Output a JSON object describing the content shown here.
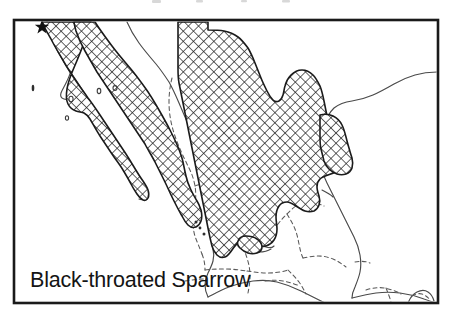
{
  "figure": {
    "kind": "species-range-map",
    "caption": "Black-throated Sparrow",
    "region_label": "Mexico and Baja California",
    "frame": {
      "x": 14,
      "y": 20,
      "width": 424,
      "height": 283,
      "stroke_color": "#1a1a1a",
      "fill_color": "#ffffff"
    },
    "legend": {
      "range_fill_label": "cross-hatched breeding/resident range",
      "range_pattern": "cross-hatch",
      "range_stroke_color": "#1b1b1b",
      "coastline_color": "#4a4a4a",
      "state_border_color": "#585858",
      "state_border_style": "dashed",
      "marker_label": "star-marker",
      "marker_color": "#121212"
    },
    "markers": [
      {
        "name": "star-marker",
        "glyph": "star",
        "x": 42,
        "y": 26
      }
    ],
    "islands": [
      {
        "name": "isla-guadalupe",
        "x": 33,
        "y": 88
      },
      {
        "name": "isla-cedros",
        "x": 71,
        "y": 99
      },
      {
        "name": "isla-angel-de-la-guarda",
        "x": 99,
        "y": 91
      },
      {
        "name": "isla-tiburon",
        "x": 115,
        "y": 88
      },
      {
        "name": "isla-santa-margarita",
        "x": 67,
        "y": 118
      },
      {
        "name": "islas-marias-a",
        "x": 196,
        "y": 222
      },
      {
        "name": "islas-marias-b",
        "x": 200,
        "y": 228
      },
      {
        "name": "islas-marias-c",
        "x": 204,
        "y": 233
      }
    ],
    "caption_position": {
      "x": 30,
      "y": 287
    }
  }
}
